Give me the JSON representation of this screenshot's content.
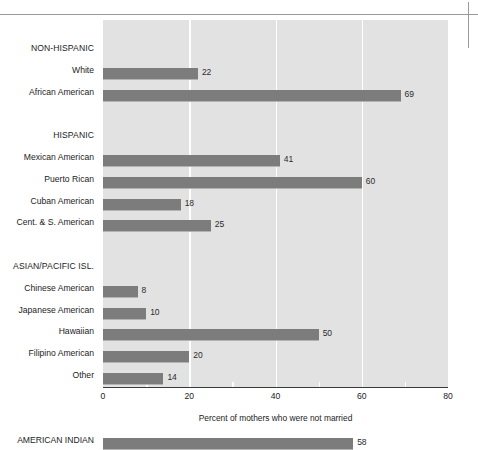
{
  "chart_data": {
    "type": "bar",
    "orientation": "horizontal",
    "title": "",
    "xlabel": "Percent of mothers who were not married",
    "ylabel": "",
    "xlim": [
      0,
      80
    ],
    "xticks": [
      0,
      20,
      40,
      60,
      80
    ],
    "xticklabels": [
      "0",
      "20",
      "40",
      "60",
      "80"
    ],
    "grid": true,
    "grid_axis": "x",
    "legend": false,
    "colors": {
      "bar": "#7c7c7c",
      "bar_edge": "#b3b3b3",
      "plot_background": "#e2e2e2",
      "gridline": "#ffffff",
      "axis": "#3a3a3a",
      "text": "#1c1c1c"
    },
    "rows": [
      {
        "label": "NON-HISPANIC",
        "kind": "group",
        "value": null
      },
      {
        "label": "White",
        "kind": "bar",
        "value": 22
      },
      {
        "label": "African American",
        "kind": "bar",
        "value": 69
      },
      {
        "label": "",
        "kind": "spacer",
        "value": null
      },
      {
        "label": "HISPANIC",
        "kind": "group",
        "value": null
      },
      {
        "label": "Mexican American",
        "kind": "bar",
        "value": 41
      },
      {
        "label": "Puerto Rican",
        "kind": "bar",
        "value": 60
      },
      {
        "label": "Cuban American",
        "kind": "bar",
        "value": 18
      },
      {
        "label": "Cent. & S. American",
        "kind": "bar",
        "value": 25
      },
      {
        "label": "",
        "kind": "spacer",
        "value": null
      },
      {
        "label": "ASIAN/PACIFIC ISL.",
        "kind": "group",
        "value": null
      },
      {
        "label": "Chinese American",
        "kind": "bar",
        "value": 8
      },
      {
        "label": "Japanese American",
        "kind": "bar",
        "value": 10
      },
      {
        "label": "Hawaiian",
        "kind": "bar",
        "value": 50
      },
      {
        "label": "Filipino American",
        "kind": "bar",
        "value": 20
      },
      {
        "label": "Other",
        "kind": "bar",
        "value": 14
      },
      {
        "label": "",
        "kind": "spacer",
        "value": null
      },
      {
        "label": "",
        "kind": "spacer",
        "value": null
      },
      {
        "label": "AMERICAN INDIAN",
        "kind": "bar",
        "value": 58
      }
    ],
    "categories": [
      "White",
      "African American",
      "Mexican American",
      "Puerto Rican",
      "Cuban American",
      "Cent. & S. American",
      "Chinese American",
      "Japanese American",
      "Hawaiian",
      "Filipino American",
      "Other",
      "AMERICAN INDIAN"
    ],
    "values": [
      22,
      69,
      41,
      60,
      18,
      25,
      8,
      10,
      50,
      20,
      14,
      58
    ]
  }
}
